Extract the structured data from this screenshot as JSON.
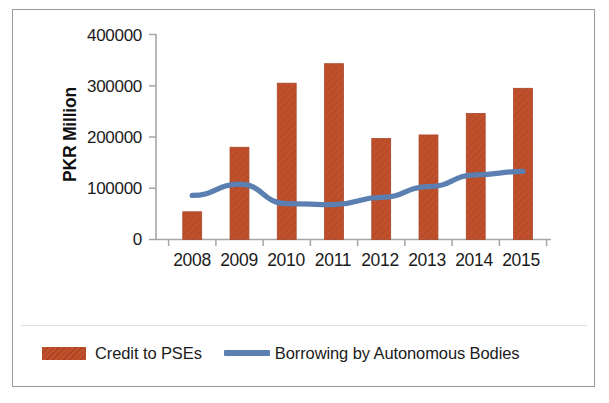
{
  "figure": {
    "border_color": "#9a9a9a",
    "background": "#ffffff"
  },
  "axes": {
    "y_title": "PKR Million",
    "y_ticks": [
      "0",
      "100000",
      "200000",
      "300000",
      "400000"
    ],
    "x_ticks": [
      "2008",
      "2009",
      "2010",
      "2011",
      "2012",
      "2013",
      "2014",
      "2015"
    ]
  },
  "legend": {
    "entries": [
      {
        "label": "Credit to PSEs",
        "marker": "bar-swatch-icon",
        "color": "#C0502B"
      },
      {
        "label": "Borrowing by Autonomous Bodies",
        "marker": "line-swatch-icon",
        "color": "#5B7FB0"
      }
    ]
  },
  "chart_data": {
    "type": "bar",
    "title": "",
    "subtitle": "",
    "xlabel": "",
    "ylabel": "PKR Million",
    "ylim": [
      0,
      400000
    ],
    "yticks": [
      0,
      100000,
      200000,
      300000,
      400000
    ],
    "grid": false,
    "legend_position": "bottom",
    "categories": [
      "2008",
      "2009",
      "2010",
      "2011",
      "2012",
      "2013",
      "2014",
      "2015"
    ],
    "series": [
      {
        "name": "Credit to PSEs",
        "type": "bar",
        "color": "#C0502B",
        "values": [
          54000,
          180000,
          305000,
          343000,
          197000,
          204000,
          246000,
          295000
        ]
      },
      {
        "name": "Borrowing by Autonomous Bodies",
        "type": "line",
        "color": "#5B7FB0",
        "values": [
          86000,
          108000,
          70000,
          68000,
          82000,
          103000,
          126000,
          133000
        ]
      }
    ]
  }
}
